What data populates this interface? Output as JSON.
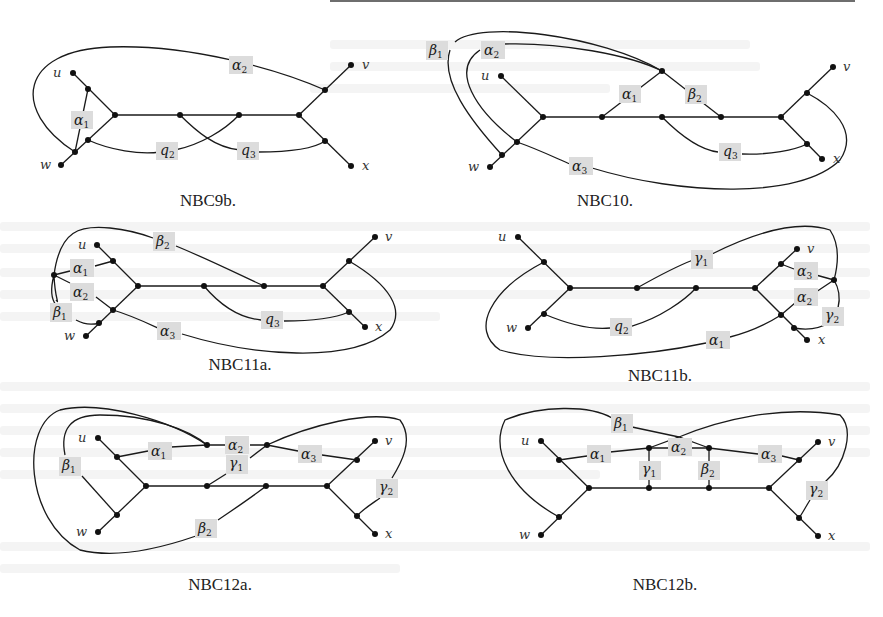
{
  "page": {
    "top_rule": true
  },
  "figures": [
    {
      "id": "nbc9b",
      "caption": "NBC9b.",
      "vertex_labels": {
        "u": "u",
        "v": "v",
        "w": "w",
        "x": "x"
      },
      "edge_labels": [
        {
          "greek": "α",
          "sub": "1"
        },
        {
          "greek": "α",
          "sub": "2"
        },
        {
          "greek": "q",
          "sub": "2"
        },
        {
          "greek": "q",
          "sub": "3"
        }
      ]
    },
    {
      "id": "nbc10",
      "caption": "NBC10.",
      "vertex_labels": {
        "u": "u",
        "v": "v",
        "w": "w",
        "x": "x"
      },
      "edge_labels": [
        {
          "greek": "β",
          "sub": "1"
        },
        {
          "greek": "α",
          "sub": "2"
        },
        {
          "greek": "α",
          "sub": "1"
        },
        {
          "greek": "β",
          "sub": "2"
        },
        {
          "greek": "q",
          "sub": "3"
        },
        {
          "greek": "α",
          "sub": "3"
        }
      ]
    },
    {
      "id": "nbc11a",
      "caption": "NBC11a.",
      "vertex_labels": {
        "u": "u",
        "v": "v",
        "w": "w",
        "x": "x"
      },
      "edge_labels": [
        {
          "greek": "β",
          "sub": "2"
        },
        {
          "greek": "α",
          "sub": "1"
        },
        {
          "greek": "α",
          "sub": "2"
        },
        {
          "greek": "β",
          "sub": "1"
        },
        {
          "greek": "α",
          "sub": "3"
        },
        {
          "greek": "q",
          "sub": "3"
        }
      ]
    },
    {
      "id": "nbc11b",
      "caption": "NBC11b.",
      "vertex_labels": {
        "u": "u",
        "v": "v",
        "w": "w",
        "x": "x"
      },
      "edge_labels": [
        {
          "greek": "γ",
          "sub": "1"
        },
        {
          "greek": "α",
          "sub": "3"
        },
        {
          "greek": "α",
          "sub": "2"
        },
        {
          "greek": "γ",
          "sub": "2"
        },
        {
          "greek": "q",
          "sub": "2"
        },
        {
          "greek": "α",
          "sub": "1"
        }
      ]
    },
    {
      "id": "nbc12a",
      "caption": "NBC12a.",
      "vertex_labels": {
        "u": "u",
        "v": "v",
        "w": "w",
        "x": "x"
      },
      "edge_labels": [
        {
          "greek": "β",
          "sub": "1"
        },
        {
          "greek": "α",
          "sub": "1"
        },
        {
          "greek": "α",
          "sub": "2"
        },
        {
          "greek": "γ",
          "sub": "1"
        },
        {
          "greek": "α",
          "sub": "3"
        },
        {
          "greek": "γ",
          "sub": "2"
        },
        {
          "greek": "β",
          "sub": "2"
        }
      ]
    },
    {
      "id": "nbc12b",
      "caption": "NBC12b.",
      "vertex_labels": {
        "u": "u",
        "v": "v",
        "w": "w",
        "x": "x"
      },
      "edge_labels": [
        {
          "greek": "β",
          "sub": "1"
        },
        {
          "greek": "α",
          "sub": "1"
        },
        {
          "greek": "α",
          "sub": "2"
        },
        {
          "greek": "γ",
          "sub": "1"
        },
        {
          "greek": "β",
          "sub": "2"
        },
        {
          "greek": "α",
          "sub": "3"
        },
        {
          "greek": "γ",
          "sub": "2"
        }
      ]
    }
  ]
}
